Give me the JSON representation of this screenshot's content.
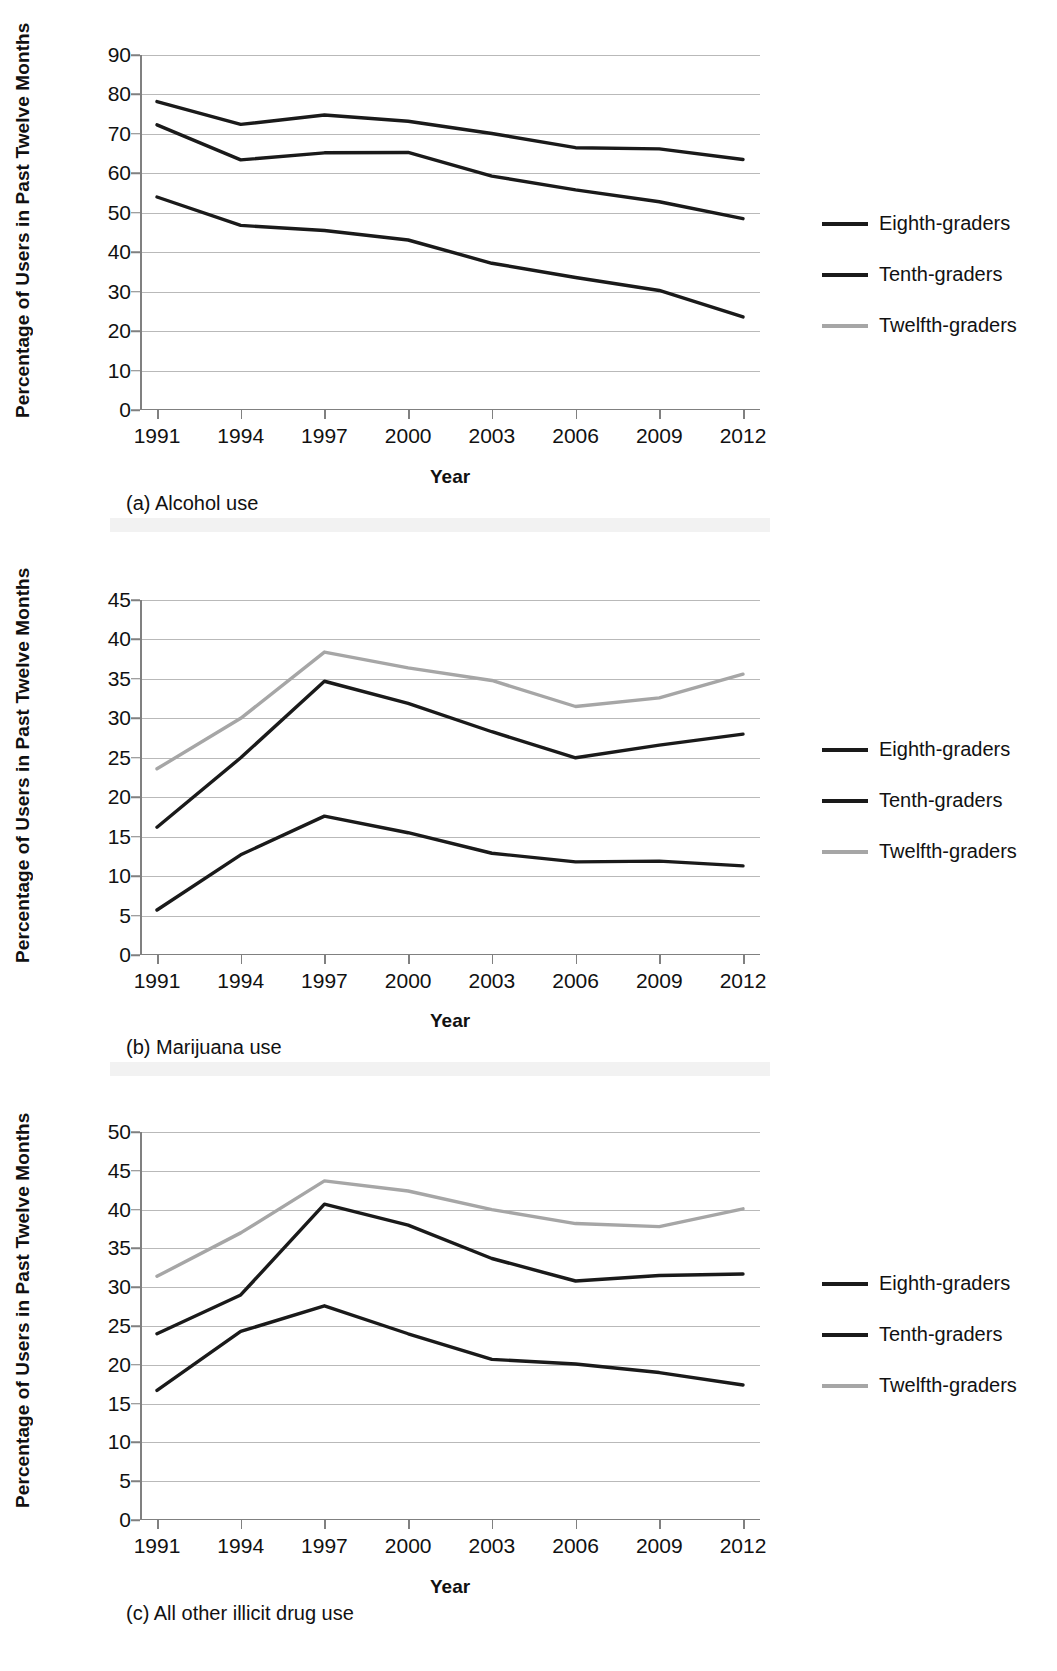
{
  "figure": {
    "y_axis_title": "Percentage of Users in Past Twelve Months",
    "x_axis_title": "Year"
  },
  "legend": {
    "items": [
      {
        "label": "Eighth-graders",
        "color": "#1a1a1a"
      },
      {
        "label": "Tenth-graders",
        "color": "#1a1a1a"
      },
      {
        "label": "Twelfth-graders",
        "color": "#a6a6a6"
      }
    ]
  },
  "panels": [
    {
      "caption": "(a) Alcohol use",
      "y_ticks": [
        "0",
        "10",
        "20",
        "30",
        "40",
        "50",
        "60",
        "70",
        "80",
        "90"
      ],
      "x_ticks": [
        "1991",
        "1994",
        "1997",
        "2000",
        "2003",
        "2006",
        "2009",
        "2012"
      ]
    },
    {
      "caption": "(b) Marijuana use",
      "y_ticks": [
        "0",
        "5",
        "10",
        "15",
        "20",
        "25",
        "30",
        "35",
        "40",
        "45"
      ],
      "x_ticks": [
        "1991",
        "1994",
        "1997",
        "2000",
        "2003",
        "2006",
        "2009",
        "2012"
      ]
    },
    {
      "caption": "(c) All other illicit drug use",
      "y_ticks": [
        "0",
        "5",
        "10",
        "15",
        "20",
        "25",
        "30",
        "35",
        "40",
        "45",
        "50"
      ],
      "x_ticks": [
        "1991",
        "1994",
        "1997",
        "2000",
        "2003",
        "2006",
        "2009",
        "2012"
      ]
    }
  ],
  "chart_data": [
    {
      "type": "line",
      "title": "(a) Alcohol use",
      "xlabel": "Year",
      "ylabel": "Percentage of Users in Past Twelve Months",
      "categories": [
        1991,
        1994,
        1997,
        2000,
        2003,
        2006,
        2009,
        2012
      ],
      "ylim": [
        0,
        90
      ],
      "ytick_step": 10,
      "grid": true,
      "legend_position": "right",
      "series": [
        {
          "name": "Eighth-graders",
          "color": "#1a1a1a",
          "values": [
            54.0,
            46.8,
            45.5,
            43.1,
            37.2,
            33.6,
            30.3,
            23.6
          ]
        },
        {
          "name": "Tenth-graders",
          "color": "#1a1a1a",
          "values": [
            72.3,
            63.4,
            65.2,
            65.3,
            59.3,
            55.8,
            52.8,
            48.5
          ]
        },
        {
          "name": "Twelfth-graders",
          "color": "#1a1a1a",
          "values": [
            78.2,
            72.4,
            74.8,
            73.2,
            70.1,
            66.5,
            66.2,
            63.5
          ]
        }
      ],
      "note": "Lowest (gray) line is Twelfth-graders per legend ordering in source figure; plotted top-to-bottom the upper two curves are black."
    },
    {
      "type": "line",
      "title": "(b) Marijuana use",
      "xlabel": "Year",
      "ylabel": "Percentage of Users in Past Twelve Months",
      "categories": [
        1991,
        1994,
        1997,
        2000,
        2003,
        2006,
        2009,
        2012
      ],
      "ylim": [
        0,
        45
      ],
      "ytick_step": 5,
      "grid": true,
      "legend_position": "right",
      "series": [
        {
          "name": "Eighth-graders",
          "color": "#1a1a1a",
          "values": [
            5.7,
            12.7,
            17.6,
            15.5,
            12.9,
            11.8,
            11.9,
            11.3
          ]
        },
        {
          "name": "Tenth-graders",
          "color": "#1a1a1a",
          "values": [
            16.2,
            25.0,
            34.7,
            31.9,
            28.3,
            25.0,
            26.6,
            28.0
          ]
        },
        {
          "name": "Twelfth-graders",
          "color": "#a6a6a6",
          "values": [
            23.6,
            30.0,
            38.4,
            36.4,
            34.8,
            31.5,
            32.6,
            35.6
          ]
        }
      ]
    },
    {
      "type": "line",
      "title": "(c) All other illicit drug use",
      "xlabel": "Year",
      "ylabel": "Percentage of Users in Past Twelve Months",
      "categories": [
        1991,
        1994,
        1997,
        2000,
        2003,
        2006,
        2009,
        2012
      ],
      "ylim": [
        0,
        50
      ],
      "ytick_step": 5,
      "grid": true,
      "legend_position": "right",
      "series": [
        {
          "name": "Eighth-graders",
          "color": "#1a1a1a",
          "values": [
            16.7,
            24.3,
            27.6,
            24.0,
            20.7,
            20.1,
            19.0,
            17.4
          ]
        },
        {
          "name": "Tenth-graders",
          "color": "#1a1a1a",
          "values": [
            24.0,
            29.0,
            40.7,
            38.0,
            33.7,
            30.8,
            31.5,
            31.7
          ]
        },
        {
          "name": "Twelfth-graders",
          "color": "#a6a6a6",
          "values": [
            31.4,
            37.0,
            43.7,
            42.4,
            40.0,
            38.2,
            37.8,
            40.1
          ]
        }
      ]
    }
  ]
}
